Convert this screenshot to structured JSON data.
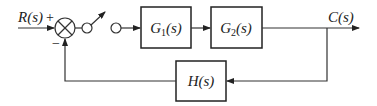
{
  "diagram": {
    "type": "block-diagram",
    "title": "",
    "input": {
      "label": "R(s)",
      "sign": "+"
    },
    "feedback_sign": "−",
    "summing_junction": {
      "symbol": "⊗"
    },
    "switch": {
      "description": "sampling switch"
    },
    "blocks": [
      {
        "id": "G1",
        "label": "G",
        "sub": "1",
        "suffix": "(s)"
      },
      {
        "id": "G2",
        "label": "G",
        "sub": "2",
        "suffix": "(s)"
      },
      {
        "id": "H",
        "label": "H(s)"
      }
    ],
    "output": {
      "label": "C(s)"
    },
    "edges": [
      {
        "from": "R(s)",
        "to": "summing_junction"
      },
      {
        "from": "summing_junction",
        "to": "switch"
      },
      {
        "from": "switch",
        "to": "G1"
      },
      {
        "from": "G1",
        "to": "G2"
      },
      {
        "from": "G2",
        "to": "C(s)"
      },
      {
        "from": "C(s)",
        "to": "H"
      },
      {
        "from": "H",
        "to": "summing_junction",
        "sign": "−"
      }
    ]
  }
}
